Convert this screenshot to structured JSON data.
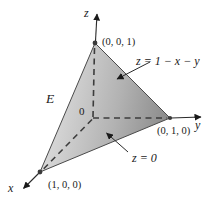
{
  "figure": {
    "background_color": "#ffffff",
    "line_color": "#2a2a2a",
    "dash_color": "#3c3c3c",
    "face_gradient": {
      "light": "#dedede",
      "mid": "#b2b2b2",
      "dark": "#868686"
    },
    "labels": {
      "z_axis": "z",
      "y_axis": "y",
      "x_axis": "x",
      "apex_vertex": "(0, 0, 1)",
      "right_vertex": "(0, 1, 0)",
      "front_vertex": "(1, 0, 0)",
      "origin": "0",
      "solid": "E",
      "top_plane_equation": "z = 1 − x − y",
      "bottom_plane_equation": "z = 0"
    }
  }
}
